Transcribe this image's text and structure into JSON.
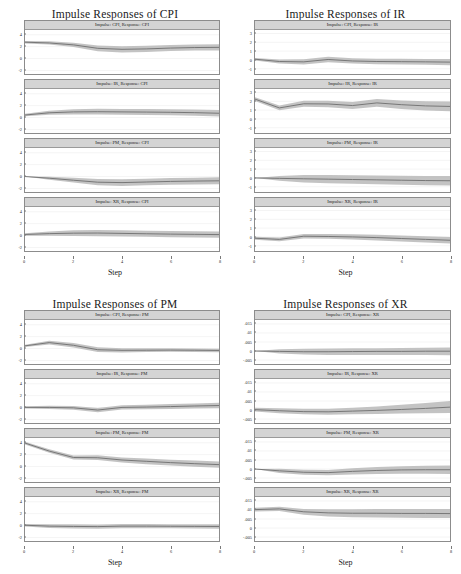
{
  "figure": {
    "xlabel": "Step",
    "xticks": [
      0,
      2,
      4,
      6,
      8
    ],
    "xlim": [
      0,
      8
    ],
    "band_color": "#b8b8b8",
    "line_color": "#6e6e6e",
    "header_color": "#d4d4d4"
  },
  "chart_data": [
    {
      "type": "line",
      "title": "Impulse Responses of CPI",
      "xlabel": "Step",
      "ylabel": "",
      "xlim": [
        0,
        8
      ],
      "ylim": [
        -2.6,
        4.8
      ],
      "yticks": [
        -2,
        0,
        2,
        4
      ],
      "ytick_labels": [
        "-2",
        "0",
        "2",
        "4"
      ],
      "grid": true,
      "legend": "none",
      "x": [
        0,
        1,
        2,
        3,
        4,
        5,
        6,
        7,
        8
      ],
      "subplots": [
        {
          "title": "Impulse: CPI, Response: CPI",
          "series": [
            {
              "name": "irf",
              "values": [
                2.75,
                2.62,
                2.3,
                1.72,
                1.55,
                1.62,
                1.76,
                1.85,
                1.88
              ]
            },
            {
              "name": "ci_lower",
              "values": [
                2.55,
                2.35,
                1.92,
                1.22,
                1.02,
                1.1,
                1.26,
                1.35,
                1.35
              ]
            },
            {
              "name": "ci_upper",
              "values": [
                2.95,
                2.9,
                2.66,
                2.2,
                2.05,
                2.14,
                2.26,
                2.35,
                2.4
              ]
            }
          ]
        },
        {
          "title": "Impulse: IR, Response: CPI",
          "series": [
            {
              "name": "irf",
              "values": [
                0.42,
                0.8,
                0.95,
                0.98,
                0.95,
                0.92,
                0.88,
                0.82,
                0.72
              ]
            },
            {
              "name": "ci_lower",
              "values": [
                0.22,
                0.46,
                0.52,
                0.5,
                0.46,
                0.42,
                0.38,
                0.3,
                0.16
              ]
            },
            {
              "name": "ci_upper",
              "values": [
                0.62,
                1.14,
                1.38,
                1.46,
                1.44,
                1.42,
                1.38,
                1.34,
                1.28
              ]
            }
          ]
        },
        {
          "title": "Impulse: PM, Response: CPI",
          "series": [
            {
              "name": "irf",
              "values": [
                0.0,
                -0.28,
                -0.62,
                -0.95,
                -1.02,
                -0.92,
                -0.82,
                -0.76,
                -0.72
              ]
            },
            {
              "name": "ci_lower",
              "values": [
                0.0,
                -0.52,
                -1.02,
                -1.48,
                -1.58,
                -1.48,
                -1.38,
                -1.32,
                -1.3
              ]
            },
            {
              "name": "ci_upper",
              "values": [
                0.0,
                -0.04,
                -0.22,
                -0.42,
                -0.46,
                -0.36,
                -0.26,
                -0.2,
                -0.14
              ]
            }
          ]
        },
        {
          "title": "Impulse: XR, Response: CPI",
          "series": [
            {
              "name": "irf",
              "values": [
                0.18,
                0.32,
                0.4,
                0.42,
                0.36,
                0.3,
                0.24,
                0.2,
                0.16
              ]
            },
            {
              "name": "ci_lower",
              "values": [
                -0.02,
                -0.04,
                -0.08,
                -0.1,
                -0.16,
                -0.22,
                -0.28,
                -0.32,
                -0.38
              ]
            },
            {
              "name": "ci_upper",
              "values": [
                0.38,
                0.68,
                0.88,
                0.94,
                0.88,
                0.82,
                0.76,
                0.72,
                0.7
              ]
            }
          ]
        }
      ]
    },
    {
      "type": "line",
      "title": "Impulse Responses of IR",
      "xlabel": "Step",
      "ylabel": "",
      "xlim": [
        0,
        8
      ],
      "ylim": [
        -1.6,
        3.4
      ],
      "yticks": [
        -1,
        0,
        1,
        2,
        3
      ],
      "ytick_labels": [
        "-1",
        "0",
        "1",
        "2",
        "3"
      ],
      "grid": true,
      "legend": "none",
      "x": [
        0,
        1,
        2,
        3,
        4,
        5,
        6,
        7,
        8
      ],
      "subplots": [
        {
          "title": "Impulse: CPI, Response: IR",
          "series": [
            {
              "name": "irf",
              "values": [
                0.08,
                -0.18,
                -0.22,
                0.05,
                -0.12,
                -0.18,
                -0.2,
                -0.22,
                -0.25
              ]
            },
            {
              "name": "ci_lower",
              "values": [
                -0.06,
                -0.42,
                -0.52,
                -0.26,
                -0.42,
                -0.48,
                -0.52,
                -0.55,
                -0.6
              ]
            },
            {
              "name": "ci_upper",
              "values": [
                0.22,
                0.06,
                0.08,
                0.36,
                0.18,
                0.12,
                0.12,
                0.11,
                0.1
              ]
            }
          ]
        },
        {
          "title": "Impulse: IR, Response: IR",
          "series": [
            {
              "name": "irf",
              "values": [
                2.25,
                1.25,
                1.72,
                1.7,
                1.52,
                1.82,
                1.62,
                1.48,
                1.42
              ]
            },
            {
              "name": "ci_lower",
              "values": [
                2.05,
                0.98,
                1.38,
                1.34,
                1.12,
                1.38,
                1.14,
                0.96,
                0.86
              ]
            },
            {
              "name": "ci_upper",
              "values": [
                2.45,
                1.52,
                2.06,
                2.06,
                1.92,
                2.26,
                2.1,
                2.0,
                1.98
              ]
            }
          ]
        },
        {
          "title": "Impulse: PM, Response: IR",
          "series": [
            {
              "name": "irf",
              "values": [
                0.0,
                -0.05,
                -0.1,
                -0.14,
                -0.18,
                -0.22,
                -0.26,
                -0.3,
                -0.32
              ]
            },
            {
              "name": "ci_lower",
              "values": [
                0.0,
                -0.32,
                -0.52,
                -0.6,
                -0.66,
                -0.72,
                -0.78,
                -0.82,
                -0.86
              ]
            },
            {
              "name": "ci_upper",
              "values": [
                0.0,
                0.22,
                0.32,
                0.32,
                0.3,
                0.28,
                0.26,
                0.22,
                0.22
              ]
            }
          ]
        },
        {
          "title": "Impulse: XR, Response: IR",
          "series": [
            {
              "name": "irf",
              "values": [
                -0.15,
                -0.28,
                0.08,
                0.05,
                0.0,
                -0.08,
                -0.18,
                -0.28,
                -0.38
              ]
            },
            {
              "name": "ci_lower",
              "values": [
                -0.32,
                -0.5,
                -0.18,
                -0.22,
                -0.3,
                -0.4,
                -0.52,
                -0.64,
                -0.76
              ]
            },
            {
              "name": "ci_upper",
              "values": [
                0.02,
                -0.06,
                0.34,
                0.32,
                0.3,
                0.24,
                0.16,
                0.08,
                0.0
              ]
            }
          ]
        }
      ]
    },
    {
      "type": "line",
      "title": "Impulse Responses of PM",
      "xlabel": "Step",
      "ylabel": "",
      "xlim": [
        0,
        8
      ],
      "ylim": [
        -2.6,
        4.8
      ],
      "yticks": [
        -2,
        0,
        2,
        4
      ],
      "ytick_labels": [
        "-2",
        "0",
        "2",
        "4"
      ],
      "grid": true,
      "legend": "none",
      "x": [
        0,
        1,
        2,
        3,
        4,
        5,
        6,
        7,
        8
      ],
      "subplots": [
        {
          "title": "Impulse: CPI, Response: PM",
          "series": [
            {
              "name": "irf",
              "values": [
                0.45,
                1.0,
                0.55,
                -0.2,
                -0.3,
                -0.28,
                -0.26,
                -0.28,
                -0.32
              ]
            },
            {
              "name": "ci_lower",
              "values": [
                0.25,
                0.7,
                0.18,
                -0.6,
                -0.66,
                -0.6,
                -0.56,
                -0.58,
                -0.62
              ]
            },
            {
              "name": "ci_upper",
              "values": [
                0.65,
                1.32,
                0.94,
                0.2,
                0.06,
                0.04,
                0.04,
                0.02,
                -0.02
              ]
            }
          ]
        },
        {
          "title": "Impulse: IR, Response: PM",
          "series": [
            {
              "name": "irf",
              "values": [
                0.02,
                0.02,
                -0.05,
                -0.42,
                0.02,
                0.08,
                0.16,
                0.26,
                0.34
              ]
            },
            {
              "name": "ci_lower",
              "values": [
                -0.18,
                -0.26,
                -0.38,
                -0.78,
                -0.34,
                -0.3,
                -0.26,
                -0.18,
                -0.12
              ]
            },
            {
              "name": "ci_upper",
              "values": [
                0.22,
                0.3,
                0.28,
                -0.06,
                0.38,
                0.46,
                0.58,
                0.7,
                0.8
              ]
            }
          ]
        },
        {
          "title": "Impulse: PM, Response: PM",
          "series": [
            {
              "name": "irf",
              "values": [
                3.95,
                2.6,
                1.52,
                1.48,
                1.1,
                0.88,
                0.66,
                0.48,
                0.32
              ]
            },
            {
              "name": "ci_lower",
              "values": [
                3.72,
                2.3,
                1.18,
                1.08,
                0.66,
                0.4,
                0.16,
                -0.04,
                -0.22
              ]
            },
            {
              "name": "ci_upper",
              "values": [
                4.18,
                2.9,
                1.86,
                1.88,
                1.54,
                1.36,
                1.16,
                1.0,
                0.86
              ]
            }
          ]
        },
        {
          "title": "Impulse: XR, Response: PM",
          "series": [
            {
              "name": "irf",
              "values": [
                0.05,
                -0.1,
                -0.15,
                -0.18,
                -0.1,
                -0.1,
                -0.12,
                -0.14,
                -0.16
              ]
            },
            {
              "name": "ci_lower",
              "values": [
                -0.18,
                -0.42,
                -0.5,
                -0.52,
                -0.44,
                -0.44,
                -0.46,
                -0.48,
                -0.52
              ]
            },
            {
              "name": "ci_upper",
              "values": [
                0.28,
                0.22,
                0.2,
                0.16,
                0.24,
                0.24,
                0.22,
                0.2,
                0.2
              ]
            }
          ]
        }
      ]
    },
    {
      "type": "line",
      "title": "Impulse Responses of XR",
      "xlabel": "Step",
      "ylabel": "",
      "xlim": [
        0,
        8
      ],
      "ylim": [
        -0.0072,
        0.0172
      ],
      "yticks": [
        -0.005,
        0,
        0.005,
        0.01,
        0.015
      ],
      "ytick_labels": [
        "-.005",
        "0",
        ".005",
        ".01",
        ".015"
      ],
      "grid": true,
      "legend": "none",
      "x": [
        0,
        1,
        2,
        3,
        4,
        5,
        6,
        7,
        8
      ],
      "subplots": [
        {
          "title": "Impulse: CPI, Response: XR",
          "series": [
            {
              "name": "irf",
              "values": [
                0.0,
                -0.0002,
                -0.0004,
                -0.0004,
                -0.0003,
                -0.0002,
                -0.0002,
                -0.0001,
                -0.0001
              ]
            },
            {
              "name": "ci_lower",
              "values": [
                0.0,
                -0.0014,
                -0.002,
                -0.0022,
                -0.0022,
                -0.0022,
                -0.0022,
                -0.0022,
                -0.0023
              ]
            },
            {
              "name": "ci_upper",
              "values": [
                0.0,
                0.001,
                0.0013,
                0.0014,
                0.0015,
                0.0016,
                0.0017,
                0.0018,
                0.0019
              ]
            }
          ]
        },
        {
          "title": "Impulse: IR, Response: XR",
          "series": [
            {
              "name": "irf",
              "values": [
                0.0002,
                -0.0004,
                -0.0009,
                -0.001,
                -0.0006,
                -0.0002,
                0.0003,
                0.0009,
                0.0016
              ]
            },
            {
              "name": "ci_lower",
              "values": [
                -0.0008,
                -0.0018,
                -0.0024,
                -0.0026,
                -0.0024,
                -0.0022,
                -0.002,
                -0.0018,
                -0.0016
              ]
            },
            {
              "name": "ci_upper",
              "values": [
                0.0012,
                0.001,
                0.0007,
                0.0007,
                0.0013,
                0.002,
                0.0029,
                0.0039,
                0.005
              ]
            }
          ]
        },
        {
          "title": "Impulse: PM, Response: XR",
          "series": [
            {
              "name": "irf",
              "values": [
                0.0,
                -0.001,
                -0.0018,
                -0.002,
                -0.0013,
                -0.0008,
                -0.0005,
                -0.0004,
                -0.0004
              ]
            },
            {
              "name": "ci_lower",
              "values": [
                0.0,
                -0.0022,
                -0.0032,
                -0.0035,
                -0.003,
                -0.0027,
                -0.0026,
                -0.0026,
                -0.0027
              ]
            },
            {
              "name": "ci_upper",
              "values": [
                0.0,
                0.0002,
                -0.0004,
                -0.0005,
                0.0004,
                0.0011,
                0.0016,
                0.0018,
                0.0019
              ]
            }
          ]
        },
        {
          "title": "Impulse: XR, Response: XR",
          "series": [
            {
              "name": "irf",
              "values": [
                0.0102,
                0.0106,
                0.009,
                0.0084,
                0.0082,
                0.0082,
                0.0081,
                0.0081,
                0.008
              ]
            },
            {
              "name": "ci_lower",
              "values": [
                0.0092,
                0.0094,
                0.0074,
                0.0064,
                0.006,
                0.0058,
                0.0057,
                0.0056,
                0.0055
              ]
            },
            {
              "name": "ci_upper",
              "values": [
                0.0112,
                0.0118,
                0.0106,
                0.0104,
                0.0104,
                0.0106,
                0.0105,
                0.0106,
                0.0105
              ]
            }
          ]
        }
      ]
    }
  ]
}
